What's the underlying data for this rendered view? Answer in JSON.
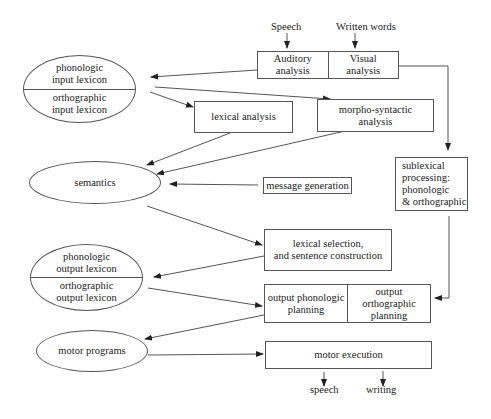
{
  "diagram": {
    "inputs": {
      "speech": "Speech",
      "written_words": "Written words"
    },
    "nodes": {
      "auditory_analysis": "Auditory\nanalysis",
      "visual_analysis": "Visual\nanalysis",
      "phonologic_input_lexicon": "phonologic\ninput lexicon",
      "orthographic_input_lexicon": "orthographic\ninput lexicon",
      "lexical_analysis": "lexical analysis",
      "morpho_syntactic_analysis": "morpho-syntactic\nanalysis",
      "semantics": "semantics",
      "message_generation": "message generation",
      "sublexical_processing": "sublexical\nprocessing:\nphonologic\n& orthographic",
      "lexical_selection": "lexical selection,\nand sentence construction",
      "phonologic_output_lexicon": "phonologic\noutput lexicon",
      "orthographic_output_lexicon": "orthographic\noutput lexicon",
      "output_phonologic_planning": "output phonologic\nplanning",
      "output_orthographic_planning": "output orthographic\nplanning",
      "motor_programs": "motor programs",
      "motor_execution": "motor execution"
    },
    "outputs": {
      "speech": "speech",
      "writing": "writing"
    },
    "edges": [
      {
        "from": "Speech",
        "to": "Auditory analysis"
      },
      {
        "from": "Written words",
        "to": "Visual analysis"
      },
      {
        "from": "Auditory analysis",
        "to": "phonologic input lexicon"
      },
      {
        "from": "input lexicon",
        "to": "lexical analysis"
      },
      {
        "from": "input lexicon",
        "to": "morpho-syntactic analysis"
      },
      {
        "from": "lexical analysis",
        "to": "semantics"
      },
      {
        "from": "morpho-syntactic analysis",
        "to": "semantics"
      },
      {
        "from": "message generation",
        "to": "semantics"
      },
      {
        "from": "Visual analysis",
        "to": "sublexical processing"
      },
      {
        "from": "semantics",
        "to": "lexical selection"
      },
      {
        "from": "lexical selection",
        "to": "output lexicon"
      },
      {
        "from": "output lexicon",
        "to": "output phonologic planning"
      },
      {
        "from": "sublexical processing",
        "to": "output orthographic planning"
      },
      {
        "from": "output phonologic planning",
        "to": "motor programs"
      },
      {
        "from": "motor programs",
        "to": "motor execution"
      },
      {
        "from": "motor execution",
        "to": "speech"
      },
      {
        "from": "motor execution",
        "to": "writing"
      }
    ],
    "colors": {
      "line": "#555555",
      "text": "#222222",
      "background": "#ffffff"
    }
  }
}
